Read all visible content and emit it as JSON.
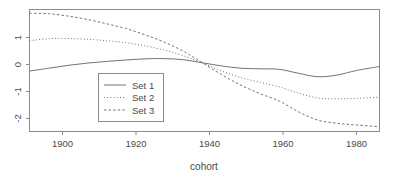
{
  "chart_data": {
    "type": "line",
    "title": "",
    "xlabel": "cohort",
    "ylabel": "",
    "xlim": [
      1895,
      1986
    ],
    "ylim": [
      -2.35,
      1.95
    ],
    "xticks": [
      1900,
      1920,
      1940,
      1960,
      1980
    ],
    "xtick_labels": [
      "1900",
      "1920",
      "1940",
      "1960",
      "1980"
    ],
    "yticks": [
      1,
      0,
      -1,
      -2
    ],
    "ytick_labels": [
      "1",
      "0",
      "-1",
      "-2"
    ],
    "grid": false,
    "legend_position": "center-left",
    "series": [
      {
        "name": "Set 1",
        "style": "solid",
        "x": [
          1895,
          1900,
          1905,
          1910,
          1915,
          1920,
          1925,
          1930,
          1935,
          1940,
          1945,
          1950,
          1955,
          1960,
          1965,
          1970,
          1975,
          1980,
          1986
        ],
        "values": [
          -0.22,
          -0.12,
          -0.02,
          0.06,
          0.12,
          0.17,
          0.21,
          0.22,
          0.18,
          0.07,
          -0.04,
          -0.12,
          -0.14,
          -0.16,
          -0.3,
          -0.42,
          -0.36,
          -0.2,
          -0.06
        ]
      },
      {
        "name": "Set 2",
        "style": "dotted",
        "x": [
          1895,
          1900,
          1905,
          1910,
          1915,
          1920,
          1925,
          1930,
          1935,
          1940,
          1945,
          1950,
          1955,
          1960,
          1965,
          1970,
          1975,
          1980,
          1986
        ],
        "values": [
          0.85,
          0.92,
          0.93,
          0.9,
          0.85,
          0.78,
          0.67,
          0.52,
          0.32,
          0.06,
          -0.22,
          -0.45,
          -0.62,
          -0.78,
          -1.0,
          -1.17,
          -1.2,
          -1.18,
          -1.14
        ]
      },
      {
        "name": "Set 3",
        "style": "dashed",
        "x": [
          1895,
          1900,
          1905,
          1910,
          1915,
          1920,
          1925,
          1930,
          1935,
          1940,
          1945,
          1950,
          1955,
          1960,
          1965,
          1970,
          1975,
          1980,
          1986
        ],
        "values": [
          1.82,
          1.8,
          1.72,
          1.6,
          1.45,
          1.28,
          1.06,
          0.8,
          0.48,
          0.07,
          -0.35,
          -0.72,
          -1.02,
          -1.28,
          -1.66,
          -1.95,
          -2.06,
          -2.12,
          -2.18
        ]
      }
    ]
  },
  "legend": {
    "items": [
      {
        "label": "Set 1"
      },
      {
        "label": "Set 2"
      },
      {
        "label": "Set 3"
      }
    ]
  },
  "colors": {
    "line": "#737373",
    "axis": "#8c8c8c",
    "text": "#4a4a4a",
    "background": "#ffffff"
  }
}
